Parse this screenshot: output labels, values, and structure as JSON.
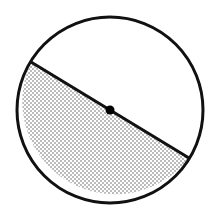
{
  "diagram": {
    "circle": {
      "cx": 110,
      "cy": 110,
      "r": 93,
      "stroke": "#111111",
      "stroke_width": 3
    },
    "diameter": {
      "x1": 31,
      "y1": 62,
      "x2": 189,
      "y2": 158
    },
    "center_point": {
      "cx": 110,
      "cy": 110,
      "r": 4.5
    },
    "shaded_region": "lower semicircle",
    "fill_pattern": "stipple",
    "dot_color": "#555555"
  }
}
